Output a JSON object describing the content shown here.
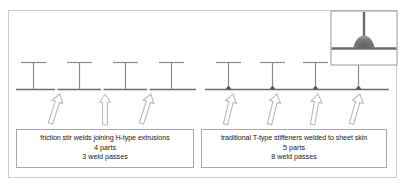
{
  "figure": {
    "colors": {
      "frame": "#cdcdcd",
      "caption_border": "#a9a9a9",
      "structure_line": "#808080",
      "skin_line": "#6e6e6e",
      "weld_dot": "#5a5a5a",
      "arrow_outline": "#b4b4b4",
      "arrow_fill": "#ffffff",
      "inset_border": "#9a9a9a",
      "inset_weld": "#6b6b6b",
      "background": "#ffffff"
    }
  },
  "left_panel": {
    "name": "friction-stir-weld-panel",
    "caption": {
      "title": "friction stir welds joining H-type extrusions",
      "parts": "4 parts",
      "passes": "3 weld passes"
    },
    "part_count": 4,
    "weld_pass_count": 3,
    "stiffener_type": "H-type extrusion",
    "stiffeners": [
      {
        "x": 33
      },
      {
        "x": 79
      },
      {
        "x": 125
      },
      {
        "x": 171
      }
    ],
    "skin_joints": [
      {
        "x": 56
      },
      {
        "x": 102
      },
      {
        "x": 148
      }
    ],
    "arrows": [
      {
        "x": 60,
        "tilt": 18
      },
      {
        "x": 105,
        "tilt": 0
      },
      {
        "x": 151,
        "tilt": 18
      }
    ]
  },
  "right_panel": {
    "name": "traditional-t-stiffener-panel",
    "caption": {
      "title": "traditional T-type stiffeners welded to sheet skin",
      "parts": "5 parts",
      "passes": "8 weld passes"
    },
    "part_count": 5,
    "weld_pass_count": 8,
    "stiffener_type": "T-type stiffener",
    "stiffeners": [
      {
        "x": 228
      },
      {
        "x": 272
      },
      {
        "x": 315
      },
      {
        "x": 358
      }
    ],
    "weld_dots": [
      {
        "x": 228
      },
      {
        "x": 272
      },
      {
        "x": 315
      },
      {
        "x": 358
      }
    ],
    "arrows": [
      {
        "x": 233,
        "tilt": 14
      },
      {
        "x": 277,
        "tilt": 14
      },
      {
        "x": 318,
        "tilt": 10
      },
      {
        "x": 360,
        "tilt": 16
      }
    ]
  },
  "inset": {
    "name": "weld-fillet-detail-inset",
    "description": "magnified detail of T-joint weld fillet between stiffener web and sheet skin",
    "box": {
      "x": 331,
      "y": 11,
      "width": 66,
      "height": 54
    }
  }
}
